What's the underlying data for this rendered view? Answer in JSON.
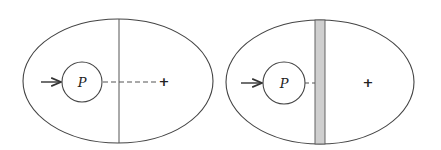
{
  "diagrams": [
    {
      "name": "left-panel",
      "particle_label": "P",
      "center_marker": "+",
      "divider": "thin-line",
      "connector": "dashed-line-to-center"
    },
    {
      "name": "right-panel",
      "particle_label": "P",
      "center_marker": "+",
      "divider": "shaded-slab",
      "connector": "short-dash-to-slab"
    }
  ],
  "colors": {
    "stroke": "#444444",
    "slab_fill": "#cfcfcf",
    "background": "#ffffff"
  }
}
